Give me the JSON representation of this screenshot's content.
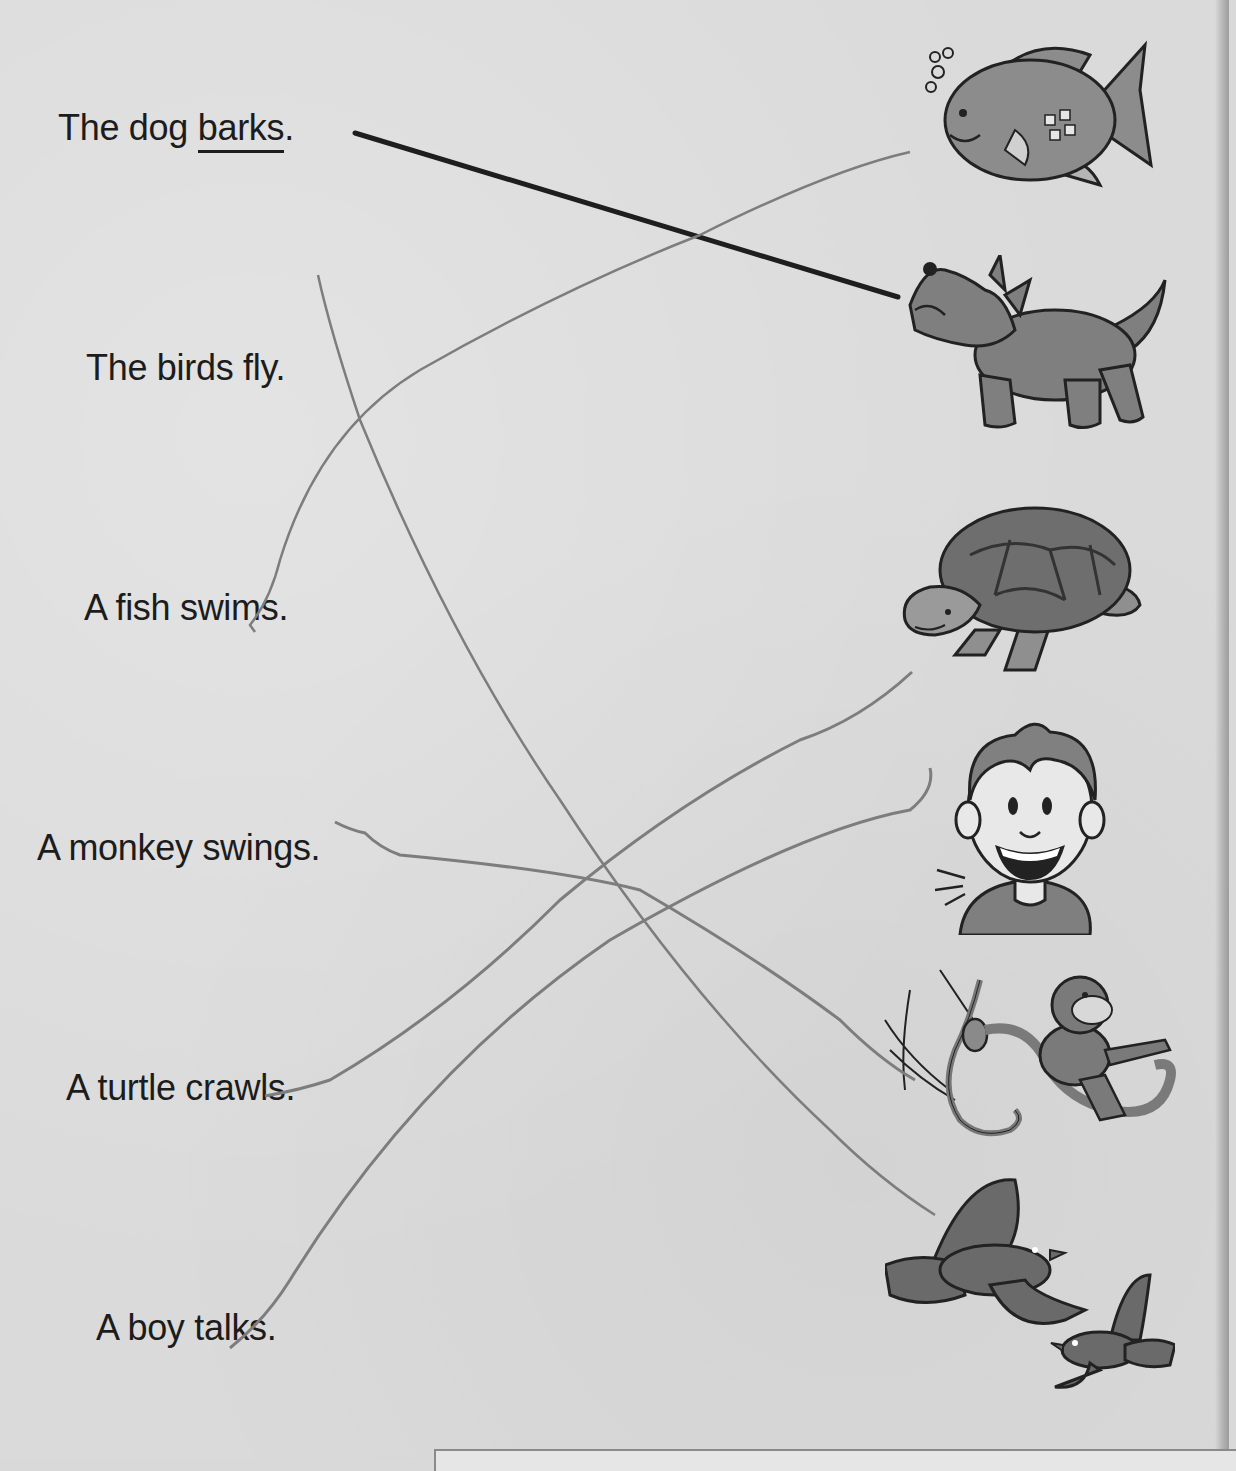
{
  "worksheet": {
    "sentences": [
      {
        "id": "dog",
        "prefix": "The dog ",
        "verb": "barks",
        "suffix": ".",
        "verb_underlined": true
      },
      {
        "id": "birds",
        "text": "The birds fly."
      },
      {
        "id": "fish",
        "text": "A fish swims."
      },
      {
        "id": "monkey",
        "text": "A monkey swings."
      },
      {
        "id": "turtle",
        "text": "A turtle crawls."
      },
      {
        "id": "boy",
        "text": "A boy talks."
      }
    ],
    "pictures": [
      {
        "id": "fish",
        "icon": "fish-icon",
        "label": "fish"
      },
      {
        "id": "dog",
        "icon": "dog-icon",
        "label": "howling dog"
      },
      {
        "id": "turtle",
        "icon": "turtle-icon",
        "label": "turtle"
      },
      {
        "id": "boy",
        "icon": "boy-icon",
        "label": "talking boy"
      },
      {
        "id": "monkey",
        "icon": "monkey-icon",
        "label": "monkey swinging on vine"
      },
      {
        "id": "birds",
        "icon": "birds-icon",
        "label": "two flying birds"
      }
    ],
    "matches": [
      {
        "from": "The dog barks.",
        "to": "dog",
        "style": "printed-example"
      },
      {
        "from": "A fish swims.",
        "to": "fish",
        "style": "pencil"
      },
      {
        "from": "The birds fly.",
        "to": "birds",
        "style": "pencil"
      },
      {
        "from": "A monkey swings.",
        "to": "monkey",
        "style": "pencil"
      },
      {
        "from": "A turtle crawls.",
        "to": "boy",
        "style": "pencil"
      },
      {
        "from": "A boy talks.",
        "to": "turtle",
        "style": "pencil"
      }
    ],
    "colors": {
      "paper": "#dadada",
      "ink": "#1c1c1c",
      "pencil": "#7d7d7d",
      "figure_fill": "#8c8c8c",
      "figure_outline": "#222222"
    }
  }
}
